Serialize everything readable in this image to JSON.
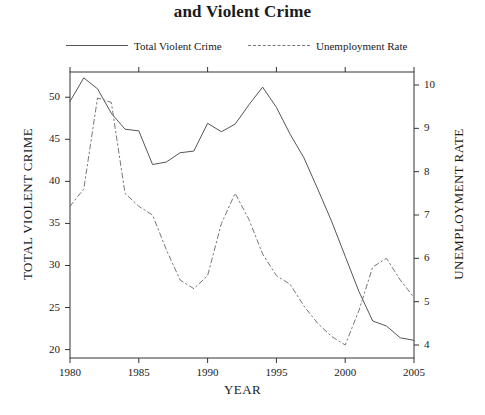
{
  "chart_data": {
    "type": "line",
    "title": "and Violent Crime",
    "xlabel": "YEAR",
    "ylabel": "TOTAL VIOLENT CRIME",
    "ylabel_right": "UNEMPLOYMENT RATE",
    "grid": false,
    "legend_position": "top",
    "x": [
      1980,
      1981,
      1982,
      1983,
      1984,
      1985,
      1986,
      1987,
      1988,
      1989,
      1990,
      1991,
      1992,
      1993,
      1994,
      1995,
      1996,
      1997,
      1998,
      1999,
      2000,
      2001,
      2002,
      2003,
      2004,
      2005
    ],
    "xlim": [
      1980,
      2005
    ],
    "xticks": [
      1980,
      1985,
      1990,
      1995,
      2000,
      2005
    ],
    "xtick_labels": [
      "1980",
      "1985",
      "1990",
      "1995",
      "2000",
      "2005"
    ],
    "ylim": [
      19.0,
      53.0
    ],
    "yticks": [
      20,
      25,
      30,
      35,
      40,
      45,
      50
    ],
    "ytick_labels": [
      "20",
      "25",
      "30",
      "35",
      "40",
      "45",
      "50"
    ],
    "ylim_right": [
      3.7,
      10.3
    ],
    "yticks_right": [
      4,
      5,
      6,
      7,
      8,
      9,
      10
    ],
    "ytick_labels_right": [
      "4",
      "5",
      "6",
      "7",
      "8",
      "9",
      "10"
    ],
    "series": [
      {
        "name": "Total Violent Crime",
        "axis": "left",
        "style": "solid",
        "color": "#555555",
        "values": [
          49.5,
          52.3,
          51.0,
          48.1,
          46.2,
          46.0,
          42.0,
          42.3,
          43.4,
          43.6,
          46.9,
          45.9,
          46.8,
          49.1,
          51.2,
          48.8,
          45.6,
          42.8,
          39.1,
          35.3,
          31.1,
          26.9,
          23.4,
          22.8,
          21.4,
          21.1
        ]
      },
      {
        "name": "Unemployment Rate",
        "axis": "right",
        "style": "dashed",
        "color": "#777777",
        "values": [
          7.2,
          7.6,
          9.7,
          9.6,
          7.5,
          7.2,
          7.0,
          6.2,
          5.5,
          5.3,
          5.6,
          6.8,
          7.5,
          6.9,
          6.1,
          5.6,
          5.4,
          4.9,
          4.5,
          4.2,
          4.0,
          4.8,
          5.8,
          6.0,
          5.5,
          5.1
        ]
      }
    ]
  },
  "legend": {
    "items": [
      {
        "label": "Total Violent Crime",
        "style": "solid"
      },
      {
        "label": "Unemployment Rate",
        "style": "dashed"
      }
    ]
  }
}
